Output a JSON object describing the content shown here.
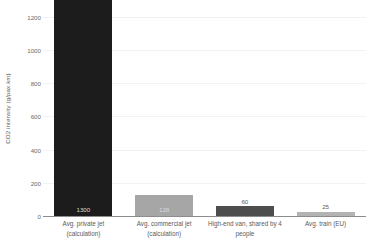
{
  "chart_data": {
    "type": "bar",
    "title": "",
    "xlabel": "",
    "ylabel": "CO2 intensity (g/pax.km)",
    "ylim": [
      0,
      1300
    ],
    "grid": true,
    "legend": "none",
    "yticks": [
      {
        "value": 0,
        "label": "0"
      },
      {
        "value": 200,
        "label": "200"
      },
      {
        "value": 400,
        "label": "400"
      },
      {
        "value": 600,
        "label": "600"
      },
      {
        "value": 800,
        "label": "800"
      },
      {
        "value": 1000,
        "label": "1000"
      },
      {
        "value": 1200,
        "label": "1200"
      }
    ],
    "categories": [
      "Avg. private jet (calculation)",
      "Avg. commercial jet (calculation)",
      "High-end van, shared by 4 people",
      "Avg. train (EU)"
    ],
    "category_lines": [
      [
        "Avg. private jet",
        "(calculation)"
      ],
      [
        "Avg. commercial jet",
        "(calculation)"
      ],
      [
        "High-end van, shared by 4",
        "people"
      ],
      [
        "Avg. train (EU)"
      ]
    ],
    "values": [
      1300,
      128,
      60,
      25
    ],
    "value_labels": [
      "1300",
      "128",
      "60",
      "25"
    ],
    "bar_colors": [
      "#1c1c1c",
      "#a6a6a6",
      "#4d4d4d",
      "#b3b3b3"
    ],
    "label_positions": [
      "inside",
      "inside",
      "above",
      "above"
    ]
  },
  "axis_colors": {
    "gridline": "#f2f2f2",
    "axis_line": "#8c8c8c",
    "tick_text": "#6b6b6b",
    "label_text": "#5a5a5a"
  }
}
